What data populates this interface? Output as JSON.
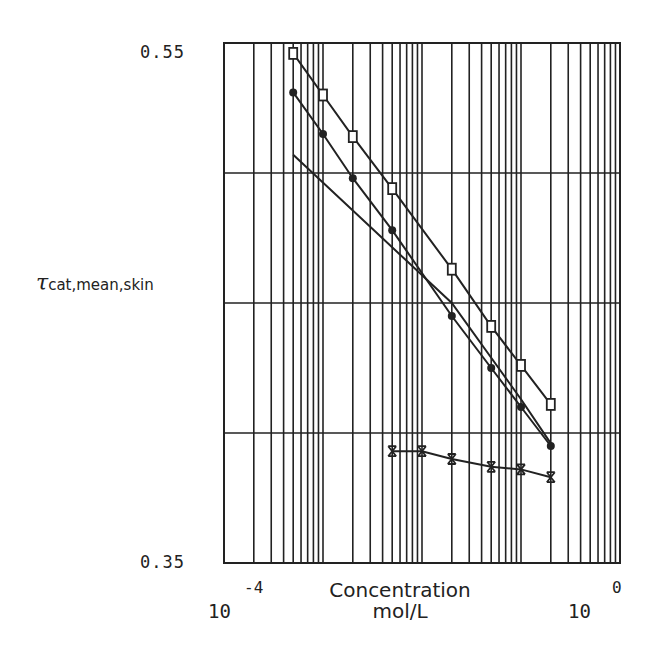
{
  "chart_data": {
    "type": "line",
    "title": "",
    "xlabel": "Concentration mol/L",
    "xlabel_line1": "Concentration",
    "xlabel_line2": "mol/L",
    "ylabel": "τcat,mean,skin",
    "ylabel_symbol": "τ",
    "ylabel_sub": "cat,mean,skin",
    "xscale": "log",
    "xlim": [
      0.0001,
      1
    ],
    "ylim": [
      0.35,
      0.55
    ],
    "x_tick_labels": [
      {
        "base": "10",
        "exp": "-4"
      },
      {
        "base": "10",
        "exp": "0"
      }
    ],
    "y_tick_labels": [
      "0.55",
      "0.35"
    ],
    "grid": {
      "horizontal": [
        0.4,
        0.45,
        0.5
      ],
      "vertical": "log decades minor grid"
    },
    "legend": "none",
    "series": [
      {
        "name": "squares",
        "marker": "square",
        "x": [
          0.0005,
          0.001,
          0.002,
          0.005,
          0.02,
          0.05,
          0.1,
          0.2
        ],
        "y": [
          0.546,
          0.53,
          0.514,
          0.494,
          0.463,
          0.441,
          0.426,
          0.411
        ]
      },
      {
        "name": "circles",
        "marker": "circle",
        "x": [
          0.0005,
          0.001,
          0.002,
          0.005,
          0.02,
          0.05,
          0.1,
          0.2
        ],
        "y": [
          0.531,
          0.515,
          0.498,
          0.478,
          0.445,
          0.425,
          0.41,
          0.395
        ]
      },
      {
        "name": "plain line",
        "marker": "none",
        "x": [
          0.0005,
          0.02,
          0.1,
          0.2
        ],
        "y": [
          0.507,
          0.45,
          0.413,
          0.396
        ]
      },
      {
        "name": "crosses",
        "marker": "x",
        "x": [
          0.005,
          0.01,
          0.02,
          0.05,
          0.1,
          0.2
        ],
        "y": [
          0.393,
          0.393,
          0.39,
          0.387,
          0.386,
          0.383
        ]
      }
    ]
  },
  "colors": {
    "ink": "#222222",
    "background": "#ffffff"
  }
}
